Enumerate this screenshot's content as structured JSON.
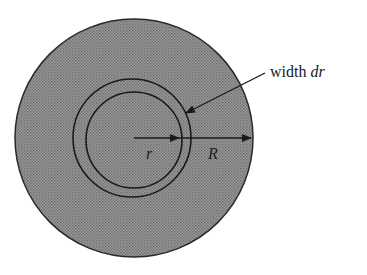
{
  "diagram": {
    "labels": {
      "annulus_prefix": "width ",
      "annulus_var": "dr",
      "inner_radius": "r",
      "outer_radius": "R"
    },
    "colors": {
      "disk_fill": "#8c8c8c",
      "stroke": "#1a1a1a",
      "background": "#ffffff"
    },
    "geometry": {
      "center": [
        134,
        138
      ],
      "outer_disk_radius": 119,
      "annulus_outer_radius": 59,
      "annulus_inner_radius": 48
    }
  }
}
